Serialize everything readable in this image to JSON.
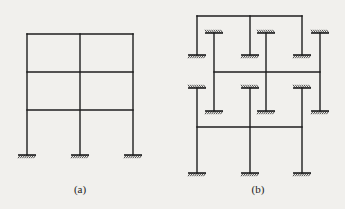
{
  "figure": {
    "panels": [
      {
        "id": "a",
        "caption": "(a)",
        "caption_pos": [
          80,
          192
        ],
        "description": "Three-storey, two-bay rigid frame with fixed supports",
        "columns_x": [
          27,
          80,
          133
        ],
        "beams_y": [
          34,
          72,
          110
        ],
        "top_y": 34,
        "ground_y": 155,
        "supports": [
          {
            "x": 27,
            "y": 155,
            "orient": "down"
          },
          {
            "x": 80,
            "y": 155,
            "orient": "down"
          },
          {
            "x": 133,
            "y": 155,
            "orient": "down"
          }
        ]
      },
      {
        "id": "b",
        "caption": "(b)",
        "caption_pos": [
          258,
          192
        ],
        "description": "Layered sub-frames (each storey isolated) with fixed far ends",
        "layers": [
          {
            "name": "top-layer",
            "beam": {
              "x1": 197,
              "x2": 302,
              "y": 16
            },
            "columns": [
              {
                "x": 197,
                "y1": 16,
                "y2": 55,
                "support_bottom": true,
                "support_top": false
              },
              {
                "x": 250,
                "y1": 16,
                "y2": 55,
                "support_bottom": true,
                "support_top": false
              },
              {
                "x": 302,
                "y1": 16,
                "y2": 55,
                "support_bottom": true,
                "support_top": false
              }
            ]
          },
          {
            "name": "middle-layer",
            "beam": {
              "x1": 214,
              "x2": 320,
              "y": 72
            },
            "columns": [
              {
                "x": 214,
                "y1": 33,
                "y2": 111,
                "support_bottom": true,
                "support_top": true
              },
              {
                "x": 266,
                "y1": 33,
                "y2": 111,
                "support_bottom": true,
                "support_top": true
              },
              {
                "x": 320,
                "y1": 33,
                "y2": 111,
                "support_bottom": true,
                "support_top": true
              }
            ]
          },
          {
            "name": "bottom-layer",
            "beam": {
              "x1": 197,
              "x2": 302,
              "y": 127
            },
            "columns": [
              {
                "x": 197,
                "y1": 88,
                "y2": 173,
                "support_bottom": true,
                "support_top": true
              },
              {
                "x": 250,
                "y1": 88,
                "y2": 173,
                "support_bottom": true,
                "support_top": true
              },
              {
                "x": 302,
                "y1": 88,
                "y2": 173,
                "support_bottom": true,
                "support_top": true
              }
            ]
          }
        ]
      }
    ],
    "colors": {
      "background": "#f1f0ed",
      "line": "#1e1e1e"
    }
  }
}
